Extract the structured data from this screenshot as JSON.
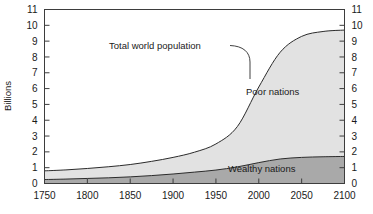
{
  "chart_data": {
    "type": "area",
    "title": "",
    "subtitle": "",
    "xlabel": "",
    "ylabel": "Billions",
    "stacked": true,
    "grid": false,
    "legend_position": "inline-annotations",
    "xlim": [
      1750,
      2100
    ],
    "ylim": [
      0,
      11
    ],
    "x_ticks": [
      1750,
      1800,
      1850,
      1900,
      1950,
      2000,
      2050,
      2100
    ],
    "x_tick_labels": [
      "1750",
      "1800",
      "1850",
      "1900",
      "1950",
      "2000",
      "2050",
      "2100"
    ],
    "y_ticks": [
      0,
      1,
      2,
      3,
      4,
      5,
      6,
      7,
      8,
      9,
      10,
      11
    ],
    "y_tick_labels": [
      "0",
      "1",
      "2",
      "3",
      "4",
      "5",
      "6",
      "7",
      "8",
      "9",
      "10",
      "11"
    ],
    "y_axis_right_labels": [
      "0",
      "1",
      "2",
      "3",
      "4",
      "5",
      "6",
      "7",
      "8",
      "9",
      "10",
      "11"
    ],
    "x": [
      1750,
      1775,
      1800,
      1825,
      1850,
      1875,
      1900,
      1925,
      1950,
      1975,
      2000,
      2025,
      2050,
      2075,
      2100
    ],
    "series": [
      {
        "name": "Wealthy nations",
        "color": "#a9a9a9",
        "values": [
          0.25,
          0.28,
          0.32,
          0.36,
          0.42,
          0.5,
          0.6,
          0.72,
          0.85,
          1.05,
          1.32,
          1.55,
          1.65,
          1.69,
          1.71
        ]
      },
      {
        "name": "Poor nations",
        "color": "#e2e2e2",
        "values": [
          0.55,
          0.58,
          0.63,
          0.7,
          0.78,
          0.9,
          1.05,
          1.26,
          1.65,
          2.55,
          4.78,
          6.75,
          7.65,
          7.92,
          7.99
        ]
      }
    ],
    "total_series": {
      "name": "Total world population",
      "values": [
        0.8,
        0.86,
        0.95,
        1.06,
        1.2,
        1.4,
        1.65,
        1.98,
        2.5,
        3.6,
        6.1,
        8.3,
        9.3,
        9.61,
        9.7
      ]
    },
    "annotations": [
      {
        "name": "total-world-population",
        "text": "Total world population",
        "leader": true
      },
      {
        "name": "poor-nations-label",
        "text": "Poor nations",
        "leader": false
      },
      {
        "name": "wealthy-nations-label",
        "text": "Wealthy nations",
        "leader": false
      }
    ],
    "colors": {
      "wealthy": "#a9a9a9",
      "poor": "#e2e2e2",
      "axis": "#3d3d3d",
      "line": "#2b2b2b",
      "background": "#ffffff"
    }
  }
}
